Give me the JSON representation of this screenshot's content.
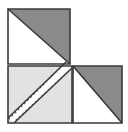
{
  "figure": {
    "canvas": {
      "width": 128,
      "height": 132,
      "background": "#ffffff"
    },
    "colors": {
      "dark_fill": "#8a8a8a",
      "light_fill": "#e2e2e2",
      "white_fill": "#ffffff",
      "outline": "#3a3a3a",
      "dash_line": "#4a4a4a"
    },
    "stroke_width": 1.6,
    "shapes": [
      {
        "name": "top-left-square",
        "kind": "square",
        "points": "8,9 70,9 70,64 8,64",
        "fill": "#ffffff",
        "label": "Top left square outline"
      },
      {
        "name": "top-left-dark-triangle",
        "kind": "triangle",
        "points": "8,9 70,9 70,64",
        "fill": "#8a8a8a",
        "label": "Upper right dark triangle of top square"
      },
      {
        "name": "top-left-white-triangle",
        "kind": "triangle",
        "points": "8,9 70,64 8,64",
        "fill": "#ffffff",
        "label": "Lower left white triangle of top square"
      },
      {
        "name": "bottom-left-light-square",
        "kind": "square",
        "points": "8,66 72,66 72,123 8,123",
        "fill": "#e2e2e2",
        "label": "Large light gray square bottom left"
      },
      {
        "name": "bottom-left-notch-triangle",
        "kind": "triangle",
        "points": "8,123 72,66 72,123",
        "fill": "#e2e2e2",
        "label": "Lower right half of light square"
      },
      {
        "name": "bottom-right-square",
        "kind": "square",
        "points": "73,66 122,66 122,123 73,123",
        "fill": "#ffffff",
        "label": "Bottom right square outline"
      },
      {
        "name": "bottom-right-dark-triangle",
        "kind": "triangle",
        "points": "73,66 122,66 122,123",
        "fill": "#8a8a8a",
        "label": "Upper right dark triangle of bottom right square"
      },
      {
        "name": "bottom-right-white-triangle",
        "kind": "triangle",
        "points": "73,66 122,123 73,123",
        "fill": "#ffffff",
        "label": "Lower left white triangle of bottom right square"
      },
      {
        "name": "diagonal-band-gap",
        "kind": "band",
        "points": "66,62 72,68 14,123 8,118",
        "fill": "#ffffff",
        "label": "White diagonal band separating halves"
      }
    ],
    "dashed_lines": [
      {
        "name": "dashed-diagonal-upper",
        "x1": 66,
        "y1": 62,
        "x2": 9,
        "y2": 119,
        "label": "Upper dashed diagonal fold line"
      },
      {
        "name": "dashed-diagonal-lower",
        "x1": 72,
        "y1": 68,
        "x2": 14,
        "y2": 122,
        "label": "Lower dashed diagonal fold line"
      }
    ],
    "solid_diagonals": [
      {
        "name": "diagonal-top-left-square",
        "x1": 8,
        "y1": 9,
        "x2": 70,
        "y2": 64,
        "label": "Diagonal of top left square"
      },
      {
        "name": "diagonal-bottom-right-square",
        "x1": 73,
        "y1": 66,
        "x2": 122,
        "y2": 123,
        "label": "Diagonal of bottom right square"
      }
    ]
  }
}
